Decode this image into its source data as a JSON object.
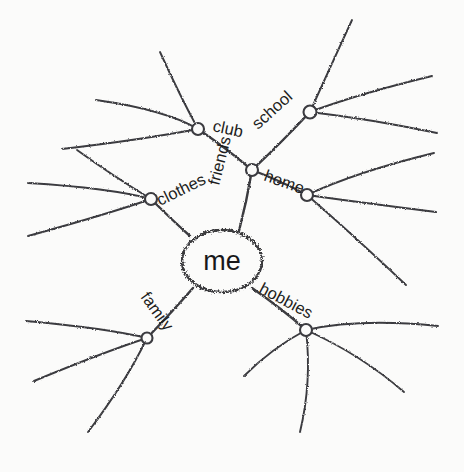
{
  "diagram": {
    "type": "hand-drawn-mind-map",
    "title": "me",
    "style": "pencil-sketch",
    "background_color": "#fbfbfa",
    "stroke_color": "#3b3b3f",
    "text_color": "#18181a",
    "center": {
      "label": "me",
      "x": 222,
      "y": 261,
      "rx": 40,
      "ry": 31
    },
    "nodes": [
      {
        "id": "clothes",
        "label": "clothes",
        "x": 151,
        "y": 199,
        "label_x": 160,
        "label_y": 206,
        "label_rotation": -26,
        "ring_radius": 6,
        "parent": "me",
        "leaf_count": 3
      },
      {
        "id": "friends",
        "label": "friends",
        "x": 252,
        "y": 170,
        "label_x": 219,
        "label_y": 186,
        "label_rotation": -76,
        "ring_radius": 6,
        "parent": "me",
        "leaf_count": 0
      },
      {
        "id": "family",
        "label": "family",
        "x": 147,
        "y": 338,
        "label_x": 140,
        "label_y": 297,
        "label_rotation": 54,
        "ring_radius": 5.5,
        "parent": "me",
        "leaf_count": 3
      },
      {
        "id": "hobbies",
        "label": "hobbies",
        "x": 306,
        "y": 330,
        "label_x": 258,
        "label_y": 292,
        "label_rotation": 28,
        "ring_radius": 6,
        "parent": "me",
        "leaf_count": 4
      },
      {
        "id": "club",
        "label": "club",
        "x": 198,
        "y": 129,
        "label_x": 212,
        "label_y": 131,
        "label_rotation": 12,
        "ring_radius": 6,
        "parent": "friends",
        "leaf_count": 3
      },
      {
        "id": "school",
        "label": "school",
        "x": 310,
        "y": 112,
        "label_x": 258,
        "label_y": 130,
        "label_rotation": -42,
        "ring_radius": 6.5,
        "parent": "friends",
        "leaf_count": 3
      },
      {
        "id": "home",
        "label": "home",
        "x": 307,
        "y": 195,
        "label_x": 263,
        "label_y": 180,
        "label_rotation": 20,
        "ring_radius": 6,
        "parent": "friends",
        "leaf_count": 3
      }
    ],
    "labels": [
      "me",
      "clothes",
      "friends",
      "family",
      "hobbies",
      "club",
      "school",
      "home"
    ],
    "branches": [
      {
        "from": "me",
        "to": "clothes",
        "path": "M 190 236 Q 172 220 151 199"
      },
      {
        "from": "me",
        "to": "friends",
        "path": "M 239 231 Q 247 200 252 170"
      },
      {
        "from": "me",
        "to": "family",
        "path": "M 193 288 Q 172 312 147 338"
      },
      {
        "from": "me",
        "to": "hobbies",
        "path": "M 252 288 Q 281 308 306 330"
      },
      {
        "from": "friends",
        "to": "club",
        "path": "M 252 170 Q 226 148 198 129"
      },
      {
        "from": "friends",
        "to": "school",
        "path": "M 252 170 Q 281 143 310 112"
      },
      {
        "from": "friends",
        "to": "home",
        "path": "M 252 170 Q 281 181 307 195"
      }
    ],
    "leaf_branches": [
      {
        "parent": "clothes",
        "path": "M 151 199 Q 113 176 77 150"
      },
      {
        "parent": "clothes",
        "path": "M 151 199 Q 110 188 28 183"
      },
      {
        "parent": "clothes",
        "path": "M 151 199 Q 108 214 28 236"
      },
      {
        "parent": "club",
        "path": "M 198 129 Q 180 96 160 52"
      },
      {
        "parent": "club",
        "path": "M 198 129 Q 166 110 96 100"
      },
      {
        "parent": "club",
        "path": "M 198 129 Q 140 140 62 149"
      },
      {
        "parent": "school",
        "path": "M 310 112 Q 328 72 352 20"
      },
      {
        "parent": "school",
        "path": "M 310 112 Q 358 94 432 76"
      },
      {
        "parent": "school",
        "path": "M 310 112 Q 370 119 437 133"
      },
      {
        "parent": "home",
        "path": "M 307 195 Q 356 172 434 153"
      },
      {
        "parent": "home",
        "path": "M 307 195 Q 364 203 436 212"
      },
      {
        "parent": "home",
        "path": "M 307 195 Q 350 232 406 285"
      },
      {
        "parent": "family",
        "path": "M 147 338 Q 105 328 26 321"
      },
      {
        "parent": "family",
        "path": "M 147 338 Q 104 352 34 381"
      },
      {
        "parent": "family",
        "path": "M 147 338 Q 126 382 88 432"
      },
      {
        "parent": "hobbies",
        "path": "M 306 330 Q 360 318 438 326"
      },
      {
        "parent": "hobbies",
        "path": "M 306 330 Q 360 354 404 392"
      },
      {
        "parent": "hobbies",
        "path": "M 306 330 Q 312 382 300 432"
      },
      {
        "parent": "hobbies",
        "path": "M 306 330 Q 272 348 244 376"
      }
    ]
  }
}
